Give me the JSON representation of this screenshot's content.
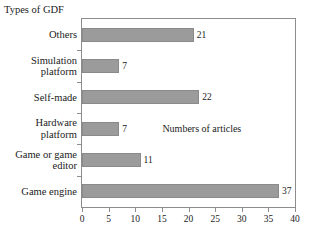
{
  "chart_data": {
    "type": "bar",
    "orientation": "horizontal",
    "title": "",
    "xlabel": "",
    "ylabel": "Types of GDF",
    "categories": [
      "Game engine",
      "Game or game editor",
      "Hardware platform",
      "Self-made",
      "Simulation platform",
      "Others"
    ],
    "category_lines": [
      [
        "Game engine"
      ],
      [
        "Game or game",
        "editor"
      ],
      [
        "Hardware",
        "platform"
      ],
      [
        "Self-made"
      ],
      [
        "Simulation",
        "platform"
      ],
      [
        "Others"
      ]
    ],
    "values": [
      37,
      11,
      7,
      22,
      7,
      21
    ],
    "value_labels": [
      "37",
      "11",
      "7",
      "22",
      "7",
      "21"
    ],
    "xlim": [
      0,
      40
    ],
    "xticks": [
      0,
      5,
      10,
      15,
      20,
      25,
      30,
      35,
      40
    ],
    "xticklabels": [
      "0",
      "5",
      "10",
      "15",
      "20",
      "25",
      "30",
      "35",
      "40"
    ],
    "grid": false,
    "legend": null,
    "annotations": [
      {
        "text": "Numbers of articles",
        "x": 22.5,
        "y_category": "Hardware platform"
      }
    ],
    "colors": {
      "bar_fill": "#9b9b9b",
      "bar_edge": "#8a8a8a",
      "frame": "#8d8d8d",
      "text": "#1a1a1a",
      "background": "#ffffff"
    }
  }
}
